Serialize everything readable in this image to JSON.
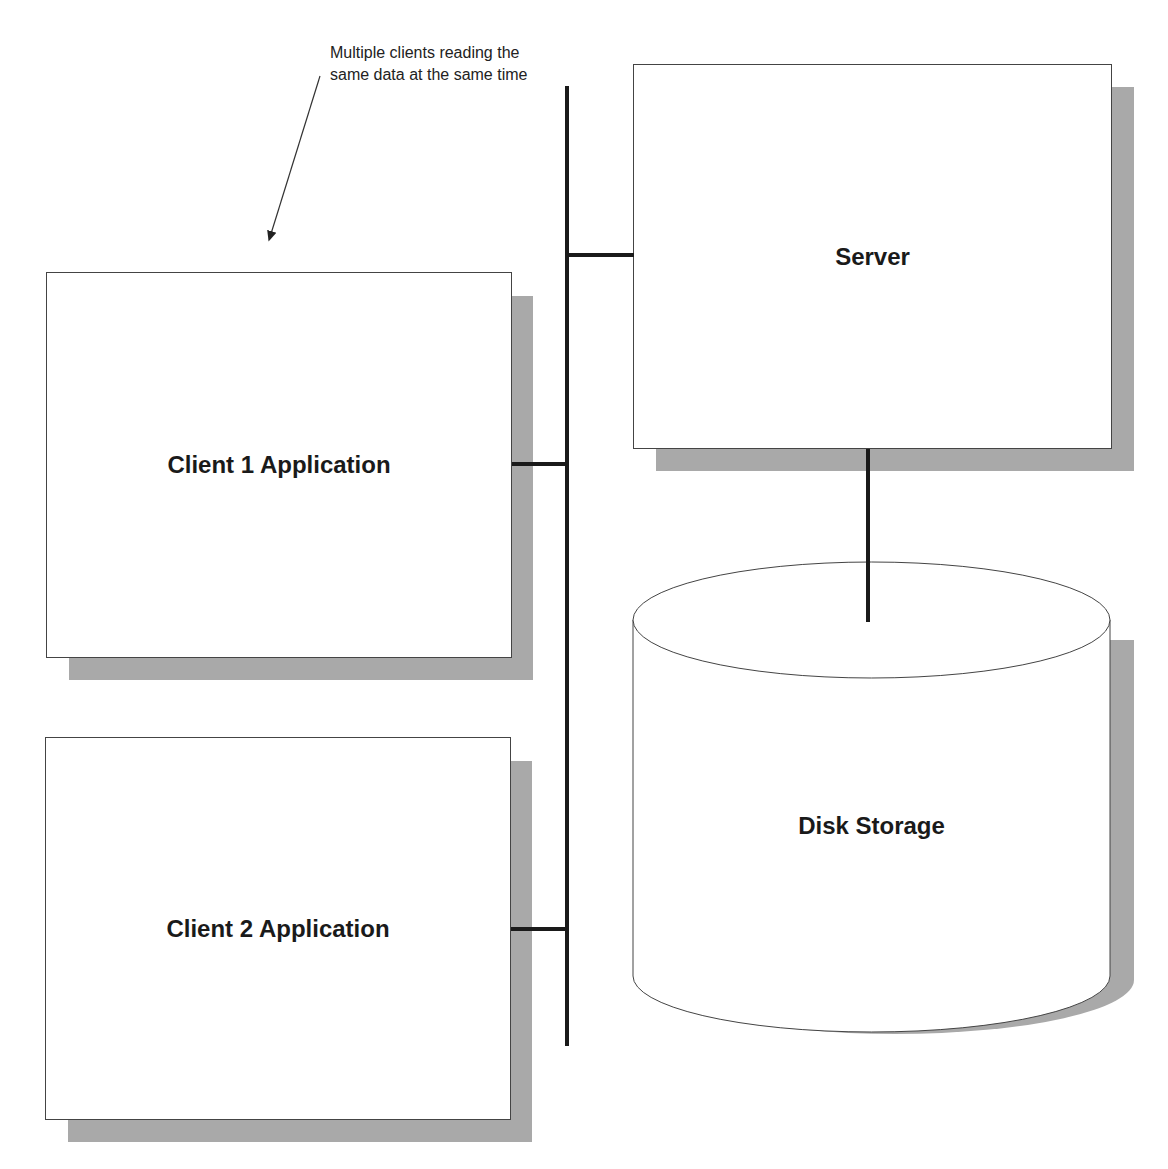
{
  "annotation": {
    "text": "Multiple clients reading the same data at the same time",
    "arrow_target": "client-1-application"
  },
  "nodes": {
    "server": {
      "label": "Server",
      "shape": "rectangle"
    },
    "client1": {
      "label": "Client 1 Application",
      "shape": "rectangle"
    },
    "client2": {
      "label": "Client 2 Application",
      "shape": "rectangle"
    },
    "disk": {
      "label": "Disk Storage",
      "shape": "cylinder"
    }
  },
  "edges": [
    {
      "from": "client1",
      "to": "network-bus"
    },
    {
      "from": "client2",
      "to": "network-bus"
    },
    {
      "from": "server",
      "to": "network-bus"
    },
    {
      "from": "server",
      "to": "disk"
    }
  ],
  "colors": {
    "shadow": "#a9a9a9",
    "line": "#1a1a1a",
    "border": "#444444",
    "background": "#ffffff"
  }
}
